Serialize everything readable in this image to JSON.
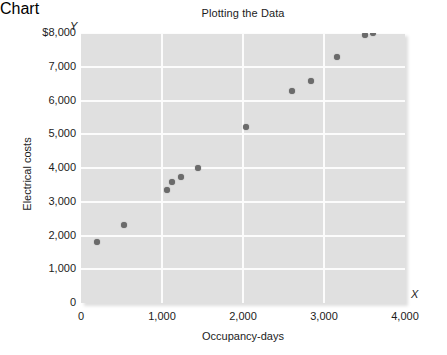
{
  "chart_data": {
    "type": "scatter",
    "title": "Plotting the Data",
    "xlabel": "Occupancy-days",
    "ylabel": "Electrical costs",
    "x_axis_name": "X",
    "y_axis_name": "Y",
    "xlim": [
      0,
      4000
    ],
    "ylim": [
      0,
      8000
    ],
    "grid": true,
    "legend": "none",
    "xticks": [
      {
        "value": 0,
        "label": "0"
      },
      {
        "value": 1000,
        "label": "1,000"
      },
      {
        "value": 2000,
        "label": "2,000"
      },
      {
        "value": 3000,
        "label": "3,000"
      },
      {
        "value": 4000,
        "label": "4,000"
      }
    ],
    "yticks": [
      {
        "value": 0,
        "label": "0"
      },
      {
        "value": 1000,
        "label": "1,000"
      },
      {
        "value": 2000,
        "label": "2,000"
      },
      {
        "value": 3000,
        "label": "3,000"
      },
      {
        "value": 4000,
        "label": "4,000"
      },
      {
        "value": 5000,
        "label": "5,000"
      },
      {
        "value": 6000,
        "label": "6,000"
      },
      {
        "value": 7000,
        "label": "7,000"
      },
      {
        "value": 8000,
        "label": "$8,000"
      }
    ],
    "points": [
      {
        "x": 200,
        "y": 1800
      },
      {
        "x": 530,
        "y": 2320
      },
      {
        "x": 1060,
        "y": 3340
      },
      {
        "x": 1120,
        "y": 3600
      },
      {
        "x": 1240,
        "y": 3720
      },
      {
        "x": 1440,
        "y": 4010
      },
      {
        "x": 2040,
        "y": 5220
      },
      {
        "x": 2600,
        "y": 6280
      },
      {
        "x": 2840,
        "y": 6570
      },
      {
        "x": 3160,
        "y": 7300
      },
      {
        "x": 3510,
        "y": 7950
      },
      {
        "x": 3600,
        "y": 7990
      }
    ],
    "colors": {
      "plot_background": "#e0e0e0",
      "gridline": "#fcfcfc",
      "point": "#6b6b6b",
      "text": "#1c1c1c"
    }
  }
}
